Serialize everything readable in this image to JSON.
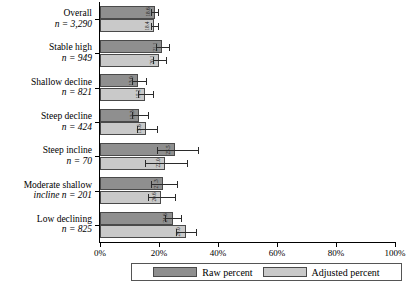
{
  "chart_data": {
    "type": "bar",
    "orientation": "horizontal",
    "title": "",
    "xlabel": "",
    "ylabel": "",
    "xlim": [
      0,
      100
    ],
    "xticks": [
      "0%",
      "20%",
      "40%",
      "60%",
      "80%",
      "100%"
    ],
    "xtick_values": [
      0,
      20,
      40,
      60,
      80,
      100
    ],
    "grid": false,
    "legend_position": "bottom",
    "categories": [
      {
        "name": "Overall",
        "n_label": "n = 3,290",
        "inline": false
      },
      {
        "name": "Stable high",
        "n_label": "n = 949",
        "inline": false
      },
      {
        "name": "Shallow decline",
        "n_label": "n = 821",
        "inline": false
      },
      {
        "name": "Steep decline",
        "n_label": "n = 424",
        "inline": false
      },
      {
        "name": "Steep incline",
        "n_label": "n = 70",
        "inline": false
      },
      {
        "name": "Moderate shallow",
        "n_label": "incline n = 201",
        "inline": false
      },
      {
        "name": "Low declining",
        "n_label": "n = 825",
        "inline": false
      }
    ],
    "series": [
      {
        "name": "Raw percent",
        "color": "#8f8f8f",
        "values": [
          18.6,
          21.1,
          13.0,
          13.3,
          25.5,
          21.3,
          24.6
        ],
        "err_low": [
          17.4,
          19.0,
          11.0,
          10.8,
          19.2,
          17.2,
          22.0
        ],
        "err_high": [
          19.8,
          23.5,
          15.6,
          16.4,
          33.1,
          26.1,
          27.6
        ],
        "value_labels": [
          "18.6",
          "21.1",
          "13.0",
          "13.3",
          "25.5",
          "21.3",
          "24.6"
        ]
      },
      {
        "name": "Adjusted percent",
        "color": "#c9c9c9",
        "values": [
          18.4,
          20.1,
          15.2,
          15.6,
          22.0,
          20.6,
          29.0
        ],
        "err_low": [
          17.2,
          17.9,
          12.8,
          12.6,
          15.1,
          16.4,
          25.8
        ],
        "err_high": [
          19.6,
          22.4,
          17.9,
          19.3,
          29.4,
          25.3,
          32.4
        ],
        "value_labels": [
          "18.4",
          "20.1",
          "15.2",
          "15.6",
          "22.0",
          "20.6",
          "29.0"
        ]
      }
    ]
  },
  "legend": {
    "raw_label": "Raw percent",
    "adjusted_label": "Adjusted percent"
  }
}
